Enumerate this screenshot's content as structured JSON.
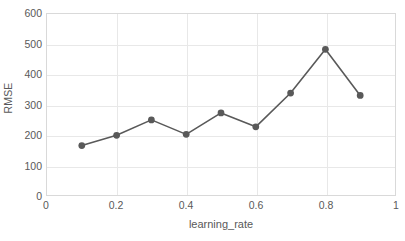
{
  "chart_data": {
    "type": "line",
    "title": "",
    "xlabel": "learning_rate",
    "ylabel": "RMSE",
    "x": [
      0.1,
      0.2,
      0.3,
      0.4,
      0.5,
      0.6,
      0.7,
      0.8,
      0.9
    ],
    "values": [
      164,
      198,
      249,
      201,
      272,
      226,
      338,
      483,
      330
    ],
    "series": [
      {
        "name": "RMSE",
        "x": [
          0.1,
          0.2,
          0.3,
          0.4,
          0.5,
          0.6,
          0.7,
          0.8,
          0.9
        ],
        "values": [
          164,
          198,
          249,
          201,
          272,
          226,
          338,
          483,
          330
        ]
      }
    ],
    "xlim": [
      0,
      1
    ],
    "ylim": [
      0,
      600
    ],
    "xticks": [
      0,
      0.2,
      0.4,
      0.6,
      0.8,
      1
    ],
    "xtick_labels": [
      "0",
      "0.2",
      "0.4",
      "0.6",
      "0.8",
      "1"
    ],
    "yticks": [
      0,
      100,
      200,
      300,
      400,
      500,
      600
    ],
    "ytick_labels": [
      "0",
      "100",
      "200",
      "300",
      "400",
      "500",
      "600"
    ],
    "grid": "horizontal-and-vertical",
    "legend": "none",
    "line_color": "#595959",
    "marker_color": "#595959",
    "marker": "circle",
    "grid_color": "#e8e8e8",
    "axis_border_color": "#d9d9d9",
    "text_color": "#595959",
    "background_color": "#ffffff"
  }
}
